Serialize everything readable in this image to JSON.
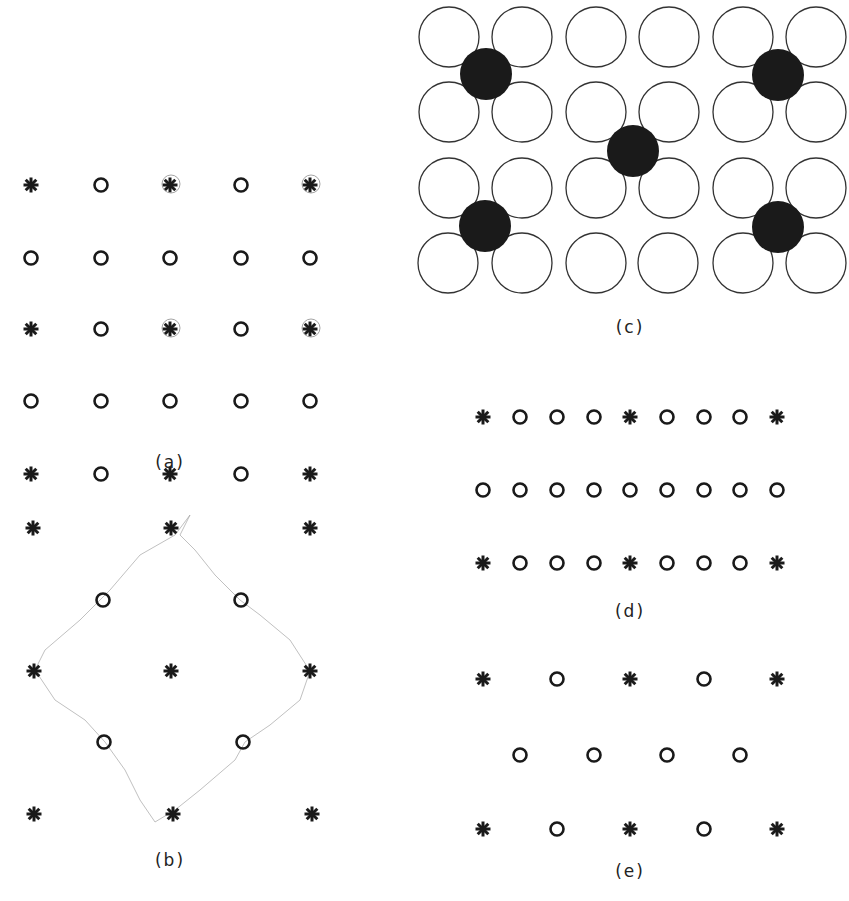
{
  "figure": {
    "panels": [
      {
        "id": "a",
        "label": "(a)",
        "label_pos": [
          170,
          468
        ],
        "rows": [
          {
            "y": 185,
            "items": [
              [
                "star",
                31
              ],
              [
                "circle",
                101
              ],
              [
                "star",
                170
              ],
              [
                "circle",
                241
              ],
              [
                "star",
                310
              ]
            ],
            "marked": [
              170,
              310
            ]
          },
          {
            "y": 258,
            "items": [
              [
                "circle",
                31
              ],
              [
                "circle",
                101
              ],
              [
                "circle",
                170
              ],
              [
                "circle",
                241
              ],
              [
                "circle",
                310
              ]
            ]
          },
          {
            "y": 329,
            "items": [
              [
                "star",
                31
              ],
              [
                "circle",
                101
              ],
              [
                "star",
                170
              ],
              [
                "circle",
                241
              ],
              [
                "star",
                310
              ]
            ],
            "marked": [
              170,
              310
            ]
          },
          {
            "y": 401,
            "items": [
              [
                "circle",
                31
              ],
              [
                "circle",
                101
              ],
              [
                "circle",
                170
              ],
              [
                "circle",
                241
              ],
              [
                "circle",
                310
              ]
            ]
          },
          {
            "y": 474,
            "items": [
              [
                "star",
                31
              ],
              [
                "circle",
                101
              ],
              [
                "star",
                170
              ],
              [
                "circle",
                241
              ],
              [
                "star",
                310
              ]
            ]
          }
        ]
      },
      {
        "id": "b",
        "label": "(b)",
        "label_pos": [
          170,
          866
        ],
        "rows": [
          {
            "y": 528,
            "items": [
              [
                "star",
                33
              ],
              [
                "star",
                171
              ],
              [
                "star",
                310
              ]
            ]
          },
          {
            "y": 600,
            "items": [
              [
                "circle",
                103
              ],
              [
                "circle",
                241
              ]
            ]
          },
          {
            "y": 671,
            "items": [
              [
                "star",
                34
              ],
              [
                "star",
                171
              ],
              [
                "star",
                310
              ]
            ]
          },
          {
            "y": 742,
            "items": [
              [
                "circle",
                104
              ],
              [
                "circle",
                243
              ]
            ]
          },
          {
            "y": 814,
            "items": [
              [
                "star",
                34
              ],
              [
                "star",
                173
              ],
              [
                "star",
                312
              ]
            ]
          }
        ],
        "outline": [
          [
            190,
            515
          ],
          [
            175,
            535
          ],
          [
            140,
            555
          ],
          [
            110,
            590
          ],
          [
            80,
            620
          ],
          [
            45,
            650
          ],
          [
            35,
            670
          ],
          [
            55,
            700
          ],
          [
            85,
            720
          ],
          [
            105,
            742
          ],
          [
            125,
            770
          ],
          [
            140,
            800
          ],
          [
            155,
            822
          ],
          [
            175,
            810
          ],
          [
            200,
            790
          ],
          [
            235,
            760
          ],
          [
            245,
            742
          ],
          [
            270,
            725
          ],
          [
            300,
            700
          ],
          [
            310,
            671
          ],
          [
            290,
            640
          ],
          [
            260,
            615
          ],
          [
            240,
            600
          ],
          [
            215,
            575
          ],
          [
            195,
            550
          ],
          [
            180,
            535
          ]
        ]
      },
      {
        "id": "c",
        "label": "(c)",
        "label_pos": [
          630,
          333
        ],
        "open_circle_radius": 30,
        "filled_circle_radius": 26,
        "open_circles": [
          [
            449,
            37
          ],
          [
            522,
            37
          ],
          [
            596,
            37
          ],
          [
            669,
            37
          ],
          [
            743,
            37
          ],
          [
            816,
            37
          ],
          [
            449,
            112
          ],
          [
            522,
            112
          ],
          [
            596,
            112
          ],
          [
            669,
            112
          ],
          [
            743,
            112
          ],
          [
            816,
            112
          ],
          [
            449,
            188
          ],
          [
            522,
            188
          ],
          [
            596,
            188
          ],
          [
            669,
            188
          ],
          [
            743,
            188
          ],
          [
            816,
            188
          ],
          [
            448,
            263
          ],
          [
            522,
            263
          ],
          [
            596,
            263
          ],
          [
            668,
            263
          ],
          [
            743,
            263
          ],
          [
            816,
            263
          ]
        ],
        "filled_circles": [
          [
            486,
            74
          ],
          [
            633,
            151
          ],
          [
            778,
            75
          ],
          [
            485,
            226
          ],
          [
            778,
            227
          ]
        ]
      },
      {
        "id": "d",
        "label": "(d)",
        "label_pos": [
          630,
          617
        ],
        "rows": [
          {
            "y": 417,
            "items": [
              [
                "star",
                483
              ],
              [
                "circle",
                520
              ],
              [
                "circle",
                557
              ],
              [
                "circle",
                594
              ],
              [
                "star",
                630
              ],
              [
                "circle",
                667
              ],
              [
                "circle",
                704
              ],
              [
                "circle",
                740
              ],
              [
                "star",
                777
              ]
            ]
          },
          {
            "y": 490,
            "items": [
              [
                "circle",
                483
              ],
              [
                "circle",
                520
              ],
              [
                "circle",
                557
              ],
              [
                "circle",
                594
              ],
              [
                "circle",
                630
              ],
              [
                "circle",
                667
              ],
              [
                "circle",
                704
              ],
              [
                "circle",
                740
              ],
              [
                "circle",
                777
              ]
            ]
          },
          {
            "y": 563,
            "items": [
              [
                "star",
                483
              ],
              [
                "circle",
                520
              ],
              [
                "circle",
                557
              ],
              [
                "circle",
                594
              ],
              [
                "star",
                630
              ],
              [
                "circle",
                667
              ],
              [
                "circle",
                704
              ],
              [
                "circle",
                740
              ],
              [
                "star",
                777
              ]
            ]
          }
        ]
      },
      {
        "id": "e",
        "label": "(e)",
        "label_pos": [
          630,
          877
        ],
        "rows": [
          {
            "y": 679,
            "items": [
              [
                "star",
                483
              ],
              [
                "circle",
                557
              ],
              [
                "star",
                630
              ],
              [
                "circle",
                704
              ],
              [
                "star",
                777
              ]
            ]
          },
          {
            "y": 755,
            "items": [
              [
                "circle",
                520
              ],
              [
                "circle",
                594
              ],
              [
                "circle",
                667
              ],
              [
                "circle",
                740
              ]
            ]
          },
          {
            "y": 829,
            "items": [
              [
                "star",
                483
              ],
              [
                "circle",
                557
              ],
              [
                "star",
                630
              ],
              [
                "circle",
                704
              ],
              [
                "star",
                777
              ]
            ]
          }
        ]
      }
    ],
    "colors": {
      "ink": "#1a1a1a",
      "pencil": "#9a9a9a",
      "background": "#ffffff"
    }
  }
}
